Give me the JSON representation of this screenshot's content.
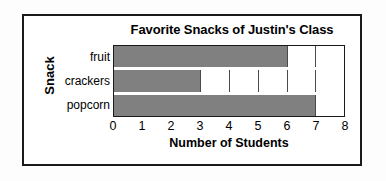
{
  "chart_data": {
    "type": "bar",
    "orientation": "horizontal",
    "title": "Favorite Snacks of Justin's Class",
    "xlabel": "Number of Students",
    "ylabel": "Snack",
    "categories": [
      "fruit",
      "crackers",
      "popcorn"
    ],
    "values": [
      6,
      3,
      7
    ],
    "xlim": [
      0,
      8
    ],
    "xticks": [
      0,
      1,
      2,
      3,
      4,
      5,
      6,
      7,
      8
    ],
    "xtick_labels": [
      "0",
      "1",
      "2",
      "3",
      "4",
      "5",
      "6",
      "7",
      "8"
    ],
    "grid": true,
    "legend": null,
    "bar_color": "#808080",
    "frame_color": "#1a1a1a",
    "background_color": "#ffffff"
  }
}
